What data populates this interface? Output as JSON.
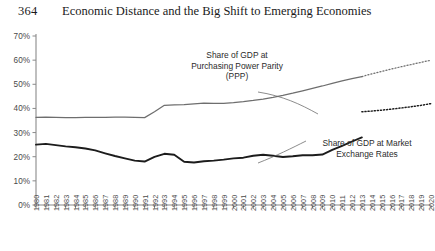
{
  "page": {
    "folio": "364",
    "running_head": "Economic Distance and the Big Shift to Emerging Economies"
  },
  "annotations": {
    "ppp": {
      "line1": "Share of GDP at",
      "line2": "Purchasing Power Parity",
      "line3": "(PPP)"
    },
    "market": {
      "line1": "Share of GDP at Market",
      "line2": "Exchange Rates"
    }
  },
  "colors": {
    "ppp_line": "#6e6e6e",
    "market_line": "#1c1c1c",
    "axis": "#8a8a8a",
    "text": "#2b2b2b",
    "background": "#ffffff"
  },
  "chart_data": {
    "type": "line",
    "title": "",
    "xlabel": "",
    "ylabel": "",
    "xlim": [
      1980,
      2020
    ],
    "ylim": [
      0,
      70
    ],
    "grid": false,
    "legend": "annotations-inline",
    "y_tick_labels": [
      "0%",
      "10%",
      "20%",
      "30%",
      "40%",
      "50%",
      "60%",
      "70%"
    ],
    "y_ticks": [
      0,
      10,
      20,
      30,
      40,
      50,
      60,
      70
    ],
    "x": [
      1980,
      1981,
      1982,
      1983,
      1984,
      1985,
      1986,
      1987,
      1988,
      1989,
      1990,
      1991,
      1992,
      1993,
      1994,
      1995,
      1996,
      1997,
      1998,
      1999,
      2000,
      2001,
      2002,
      2003,
      2004,
      2005,
      2006,
      2007,
      2008,
      2009,
      2010,
      2011,
      2012,
      2013,
      2014,
      2015,
      2016,
      2017,
      2018,
      2019,
      2020
    ],
    "x_tick_labels": [
      "1980",
      "1981",
      "1982",
      "1983",
      "1984",
      "1985",
      "1986",
      "1987",
      "1988",
      "1989",
      "1990",
      "1991",
      "1992",
      "1993",
      "1994",
      "1995",
      "1996",
      "1997",
      "1998",
      "1999",
      "2000",
      "2001",
      "2002",
      "2003",
      "2004",
      "2005",
      "2006",
      "2007",
      "2008",
      "2009",
      "2010",
      "2011",
      "2012",
      "2013",
      "2014",
      "2015",
      "2016",
      "2017",
      "2018",
      "2019",
      "2020"
    ],
    "projection_starts_at": 2013,
    "series": [
      {
        "name": "Share of GDP at Purchasing Power Parity (PPP)",
        "color": "#6e6e6e",
        "style": "solid-then-dotted",
        "values": [
          36.3,
          36.4,
          36.3,
          36.2,
          36.2,
          36.3,
          36.3,
          36.3,
          36.4,
          36.4,
          36.3,
          36.2,
          38.6,
          41.3,
          41.5,
          41.6,
          41.9,
          42.2,
          42.1,
          42.1,
          42.4,
          42.8,
          43.3,
          43.9,
          44.6,
          45.4,
          46.3,
          47.3,
          48.3,
          49.3,
          50.4,
          51.4,
          52.3,
          53.2,
          54.3,
          55.3,
          56.3,
          57.3,
          58.2,
          59.1,
          60.0
        ]
      },
      {
        "name": "Share of GDP at Market Exchange Rates",
        "color": "#1c1c1c",
        "style": "solid-then-dotted",
        "values": [
          25.0,
          25.3,
          24.8,
          24.3,
          23.9,
          23.4,
          22.6,
          21.4,
          20.3,
          19.3,
          18.4,
          18.0,
          19.9,
          21.2,
          20.8,
          17.9,
          17.6,
          18.1,
          18.4,
          18.8,
          19.3,
          19.6,
          20.4,
          20.8,
          20.4,
          19.9,
          20.2,
          20.6,
          20.6,
          20.9,
          22.8,
          24.5,
          26.3,
          28.0,
          30.6,
          33.1,
          35.4,
          37.4,
          38.4,
          38.6,
          38.6
        ]
      },
      {
        "name": "Share of GDP at Market Exchange Rates (projection)",
        "color": "#1c1c1c",
        "style": "dotted",
        "values_from_2013": [
          38.6,
          38.9,
          39.3,
          39.7,
          40.2,
          40.7,
          41.3,
          42.0
        ]
      }
    ]
  }
}
